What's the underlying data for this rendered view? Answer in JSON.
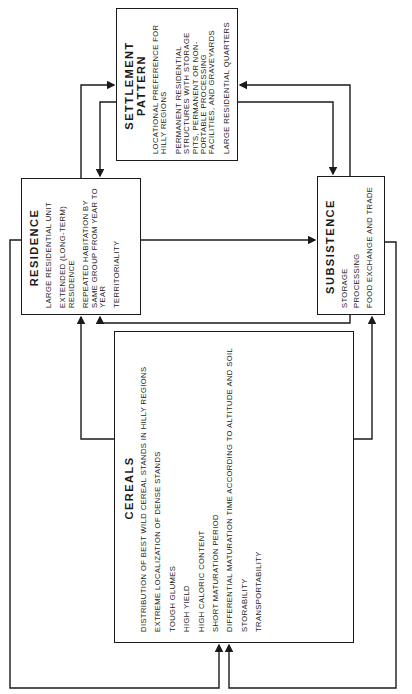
{
  "diagram": {
    "orientation": "rotated 90 degrees counter-clockwise",
    "boxes": {
      "settlement": {
        "title": "SETTLEMENT PATTERN",
        "items": [
          "LOCATIONAL PREFERENCE FOR HILLY REGIONS",
          "PERMANENT RESIDENTIAL STRUCTURES WITH STORAGE PITS, PERMANENT OR NON-PORTABLE PROCESSING FACILITIES, AND GRAVEYARDS",
          "LARGE RESIDENTIAL QUARTERS"
        ]
      },
      "residence": {
        "title": "RESIDENCE",
        "items": [
          "LARGE RESIDENTIAL UNIT",
          "EXTENDED (LONG-TERM) RESIDENCE",
          "REPEATED HABITATION BY SAME GROUP FROM YEAR TO YEAR",
          "TERRITORIALITY"
        ]
      },
      "subsistence": {
        "title": "SUBSISTENCE",
        "items": [
          "STORAGE",
          "PROCESSING",
          "FOOD EXCHANGE AND TRADE"
        ]
      },
      "cereals": {
        "title": "CEREALS",
        "items": [
          "DISTRIBUTION OF BEST WILD CEREAL STANDS IN HILLY REGIONS",
          "EXTREME LOCALIZATION OF DENSE STANDS",
          "TOUGH GLUMES",
          "HIGH YIELD",
          "HIGH CALORIC CONTENT",
          "SHORT MATURATION PERIOD",
          "DIFFERENTIAL MATURATION TIME ACCORDING TO ALTITUDE AND SOIL",
          "STORABILITY",
          "TRANSPORTABILITY"
        ]
      }
    },
    "colors": {
      "line": "#1a1a1a",
      "background": "#ffffff"
    }
  }
}
